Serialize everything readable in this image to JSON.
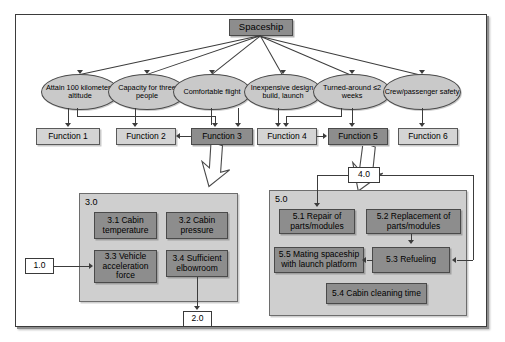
{
  "diagram": {
    "title_node": {
      "label": "Spaceship"
    },
    "requirements": [
      {
        "id": "r1",
        "label": "Attain 100 kilometers altitude"
      },
      {
        "id": "r2",
        "label": "Capacity for three people"
      },
      {
        "id": "r3",
        "label": "Comfortable flight"
      },
      {
        "id": "r4",
        "label": "Inexpensive design, build, launch"
      },
      {
        "id": "r5",
        "label": "Turned-around ≤2 weeks"
      },
      {
        "id": "r6",
        "label": "Crew/passenger safety"
      }
    ],
    "functions": [
      {
        "id": "f1",
        "label": "Function 1",
        "highlight": false
      },
      {
        "id": "f2",
        "label": "Function 2",
        "highlight": false
      },
      {
        "id": "f3",
        "label": "Function 3",
        "highlight": true
      },
      {
        "id": "f4",
        "label": "Function 4",
        "highlight": false
      },
      {
        "id": "f5",
        "label": "Function 5",
        "highlight": true
      },
      {
        "id": "f6",
        "label": "Function 6",
        "highlight": false
      }
    ],
    "group_left": {
      "label": "3.0",
      "items": [
        {
          "id": "3.1",
          "label": "3.1 Cabin temperature"
        },
        {
          "id": "3.2",
          "label": "3.2 Cabin pressure"
        },
        {
          "id": "3.3",
          "label": "3.3 Vehicle acceleration force"
        },
        {
          "id": "3.4",
          "label": "3.4 Sufficient elbowroom"
        }
      ]
    },
    "group_right": {
      "label": "5.0",
      "items": [
        {
          "id": "5.1",
          "label": "5.1 Repair of parts/modules"
        },
        {
          "id": "5.2",
          "label": "5.2 Replacement of parts/modules"
        },
        {
          "id": "5.5",
          "label": "5.5 Mating spaceship with launch platform"
        },
        {
          "id": "5.3",
          "label": "5.3 Refueling"
        },
        {
          "id": "5.4",
          "label": "5.4 Cabin cleaning time"
        }
      ]
    },
    "connectors": [
      {
        "id": "c1",
        "label": "1.0"
      },
      {
        "id": "c2",
        "label": "2.0"
      },
      {
        "id": "c4",
        "label": "4.0"
      }
    ],
    "colors": {
      "highlight_fill": "#8d8d8d",
      "plain_fill": "#d4d4d4",
      "ellipse_fill": "#c9c9c9",
      "group_fill": "#cfcfcf",
      "line": "#3c3c3c",
      "page": "#ffffff"
    }
  }
}
